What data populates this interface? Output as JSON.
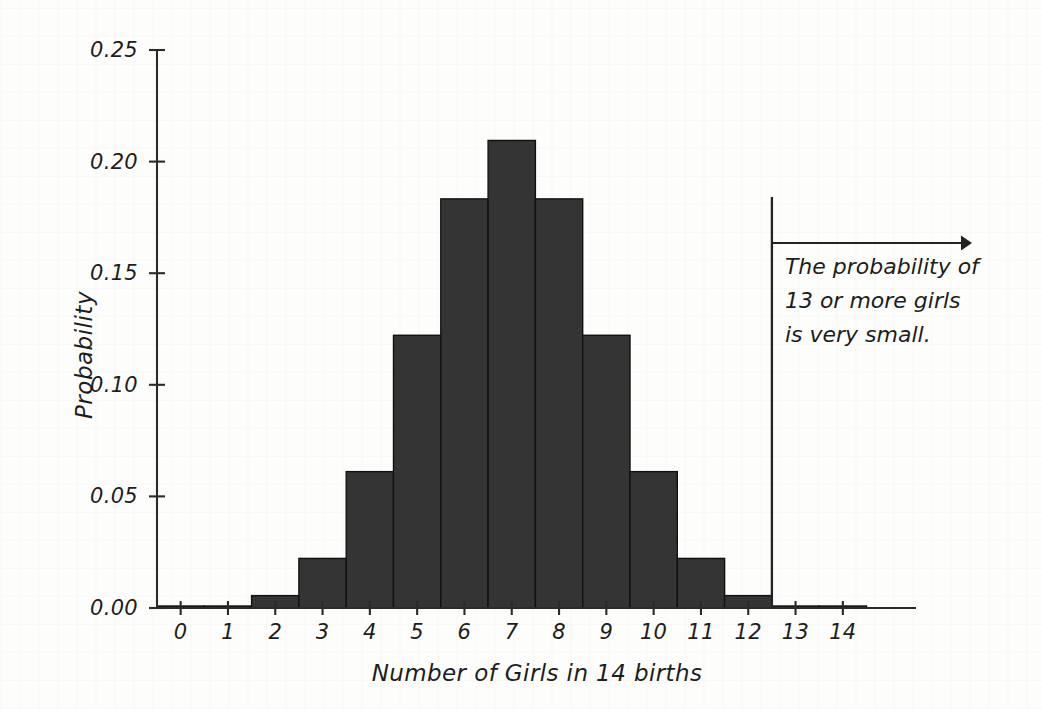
{
  "chart_data": {
    "type": "bar",
    "title": "",
    "subtitle": "",
    "xlabel": "Number of Girls in 14 births",
    "ylabel": "Probability",
    "categories": [
      "0",
      "1",
      "2",
      "3",
      "4",
      "5",
      "6",
      "7",
      "8",
      "9",
      "10",
      "11",
      "12",
      "13",
      "14"
    ],
    "values": [
      6e-05,
      0.00085,
      0.00555,
      0.02222,
      0.0611,
      0.12219,
      0.18329,
      0.20947,
      0.18329,
      0.12219,
      0.0611,
      0.02222,
      0.00555,
      0.00085,
      6e-05
    ],
    "xlim": [
      -0.5,
      14.9
    ],
    "ylim": [
      0,
      0.25
    ],
    "ytick_labels": [
      "0.00",
      "0.05",
      "0.10",
      "0.15",
      "0.20",
      "0.25"
    ],
    "ytick_values": [
      0,
      0.05,
      0.1,
      0.15,
      0.2,
      0.25
    ],
    "xtick_labels": [
      "0",
      "1",
      "2",
      "3",
      "4",
      "5",
      "6",
      "7",
      "8",
      "9",
      "10",
      "11",
      "12",
      "13",
      "14"
    ],
    "grid": false,
    "legend": false,
    "legend_position": "none",
    "bar_color": "#343434",
    "bar_edge_color": "#111111",
    "axis_color": "#2a2a2a",
    "background_color": "#fdfdfb",
    "annotations": [
      {
        "name": "threshold-callout",
        "text_lines": [
          "The probability of",
          "13 or more girls",
          "is very small."
        ],
        "marker_x_value": 12.5,
        "arrow_direction": "right",
        "color": "#232323"
      }
    ]
  },
  "axes": {
    "y_title": "Probability",
    "x_title": "Number of Girls in 14 births"
  },
  "callout": {
    "line1": "The probability of",
    "line2": "13 or more girls",
    "line3": "is very small."
  }
}
